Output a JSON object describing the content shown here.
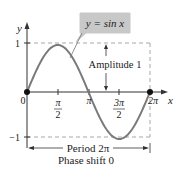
{
  "chart_data": {
    "type": "line",
    "title": "",
    "function_label": "y = sin x",
    "xlabel": "x",
    "ylabel": "y",
    "x_ticks": [
      {
        "value": 0,
        "label": "0"
      },
      {
        "value": 1.5708,
        "label_num": "π",
        "label_den": "2"
      },
      {
        "value": 3.1416,
        "label": "π"
      },
      {
        "value": 4.7124,
        "label_num": "3π",
        "label_den": "2"
      },
      {
        "value": 6.2832,
        "label": "2π"
      }
    ],
    "y_ticks": [
      {
        "value": 1,
        "label": "1"
      },
      {
        "value": -1,
        "label": "−1"
      }
    ],
    "series": [
      {
        "name": "y = sin x",
        "x": [
          0,
          0.7854,
          1.5708,
          2.3562,
          3.1416,
          3.927,
          4.7124,
          5.4978,
          6.2832
        ],
        "y": [
          0,
          0.7071,
          1,
          0.7071,
          0,
          -0.7071,
          -1,
          -0.7071,
          0
        ]
      }
    ],
    "marked_points": [
      {
        "x": 0,
        "y": 0
      },
      {
        "x": 6.2832,
        "y": 0
      }
    ],
    "annotations": {
      "amplitude": "Amplitude 1",
      "period": "Period 2π",
      "phase_shift": "Phase shift 0"
    },
    "xlim": [
      0,
      6.2832
    ],
    "ylim": [
      -1,
      1
    ],
    "grid": false,
    "colors": {
      "curve": "#7a7a7a",
      "axis": "#333333",
      "dash": "#a0a0a0",
      "label_box": "#c8c8c8",
      "point": "#111111"
    }
  }
}
